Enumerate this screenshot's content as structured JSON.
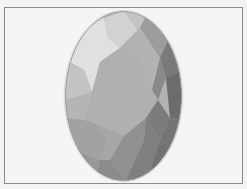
{
  "figure": {
    "style": "grayscale illustration",
    "frame_color": "#8a8a8a",
    "background_color": "#f5f5f5",
    "gem": {
      "outline_color": "#9a9a9a",
      "center": [
        123.5,
        96
      ],
      "radii": [
        58.5,
        85
      ],
      "facet_colors": {
        "highlight": "#e2e2e2",
        "light": "#cfcfcf",
        "mid_light": "#bdbdbd",
        "mid": "#acacac",
        "mid_dark": "#969696",
        "dark": "#7e7e7e",
        "darkest": "#666666"
      }
    }
  }
}
